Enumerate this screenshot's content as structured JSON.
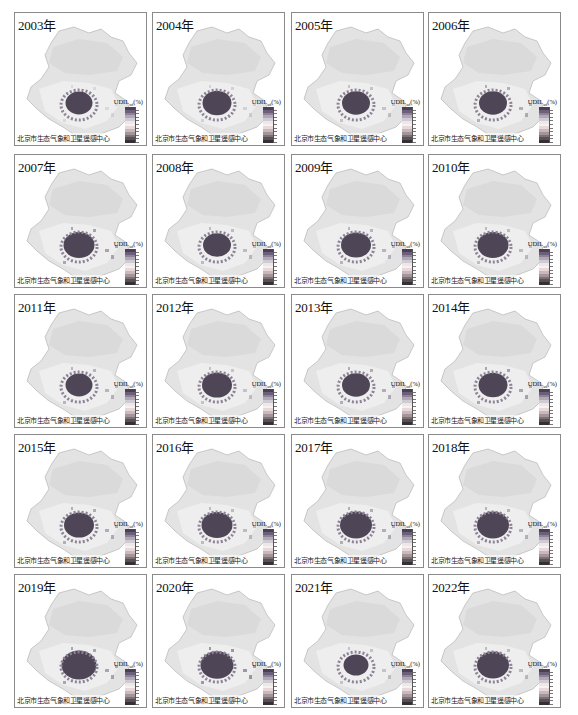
{
  "figure": {
    "caption_text": "北京市生态气象和卫星遥感中心",
    "legend_title": "UDIL",
    "legend_subscript": "ud",
    "legend_unit": "(%)",
    "legend_colors": [
      "#4a3f55",
      "#6b5f7a",
      "#8d8296",
      "#b0a8b6",
      "#d0cbd2",
      "#ece8ea",
      "#f7f2f0",
      "#e8d8dc",
      "#c9b9bd",
      "#a39599",
      "#7c7075",
      "#575055",
      "#353035"
    ],
    "panels": [
      {
        "year": "2003年",
        "row": 0,
        "col": 0,
        "core": 0.55,
        "extra": 0.15
      },
      {
        "year": "2004年",
        "row": 0,
        "col": 1,
        "core": 0.65,
        "extra": 0.2
      },
      {
        "year": "2005年",
        "row": 0,
        "col": 2,
        "core": 0.6,
        "extra": 0.3
      },
      {
        "year": "2006年",
        "row": 0,
        "col": 3,
        "core": 0.6,
        "extra": 0.45
      },
      {
        "year": "2007年",
        "row": 1,
        "col": 0,
        "core": 0.75,
        "extra": 0.5
      },
      {
        "year": "2008年",
        "row": 1,
        "col": 1,
        "core": 0.6,
        "extra": 0.35
      },
      {
        "year": "2009年",
        "row": 1,
        "col": 2,
        "core": 0.7,
        "extra": 0.4
      },
      {
        "year": "2010年",
        "row": 1,
        "col": 3,
        "core": 0.75,
        "extra": 0.35
      },
      {
        "year": "2011年",
        "row": 2,
        "col": 0,
        "core": 0.55,
        "extra": 0.4
      },
      {
        "year": "2012年",
        "row": 2,
        "col": 1,
        "core": 0.7,
        "extra": 0.3
      },
      {
        "year": "2013年",
        "row": 2,
        "col": 2,
        "core": 0.6,
        "extra": 0.45
      },
      {
        "year": "2014年",
        "row": 2,
        "col": 3,
        "core": 0.65,
        "extra": 0.5
      },
      {
        "year": "2015年",
        "row": 3,
        "col": 0,
        "core": 0.7,
        "extra": 0.45
      },
      {
        "year": "2016年",
        "row": 3,
        "col": 1,
        "core": 0.75,
        "extra": 0.35
      },
      {
        "year": "2017年",
        "row": 3,
        "col": 2,
        "core": 0.8,
        "extra": 0.45
      },
      {
        "year": "2018年",
        "row": 3,
        "col": 3,
        "core": 0.8,
        "extra": 0.4
      },
      {
        "year": "2019年",
        "row": 4,
        "col": 0,
        "core": 0.95,
        "extra": 0.5
      },
      {
        "year": "2020年",
        "row": 4,
        "col": 1,
        "core": 0.85,
        "extra": 0.6
      },
      {
        "year": "2021年",
        "row": 4,
        "col": 2,
        "core": 0.45,
        "extra": 0.3
      },
      {
        "year": "2022年",
        "row": 4,
        "col": 3,
        "core": 0.8,
        "extra": 0.35
      }
    ]
  }
}
